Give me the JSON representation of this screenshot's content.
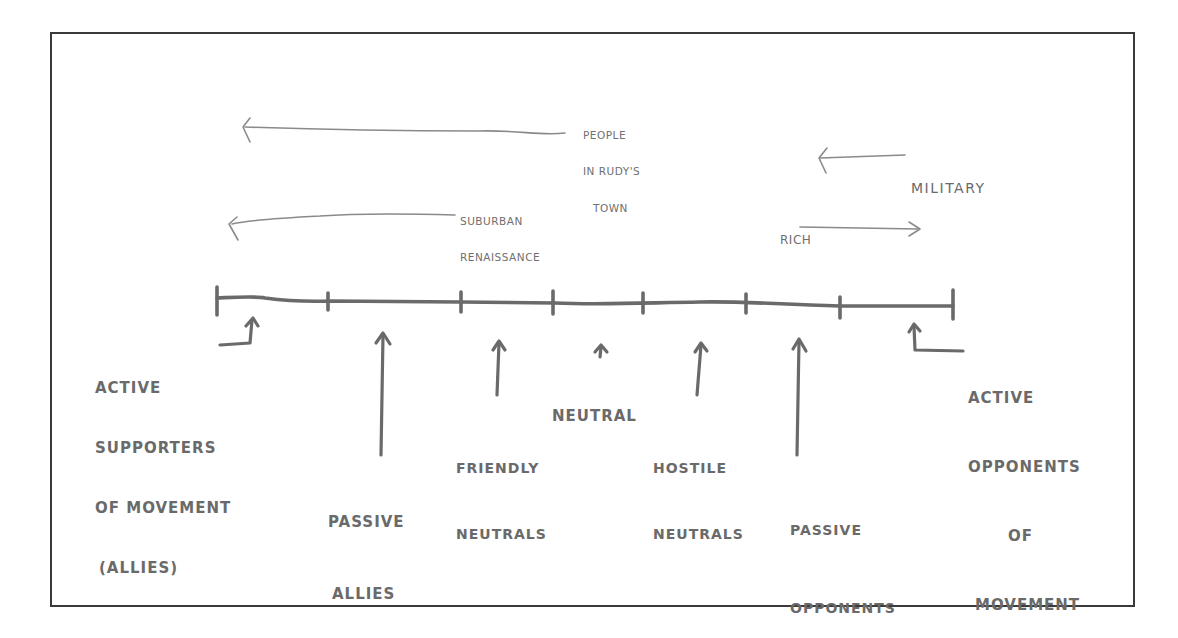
{
  "diagram": {
    "type": "spectrum-of-allegiance-sketch",
    "style": "hand-drawn",
    "stroke_color": "#6a6a6a",
    "frame_color": "#3a3a3a",
    "spectrum": {
      "left_end": "ACTIVE SUPPORTERS OF MOVEMENT (ALLIES)",
      "right_end": "ACTIVE OPPONENTS OF MOVEMENT",
      "tick_count": 8
    },
    "segments": [
      {
        "id": "active-supporters",
        "lines": [
          "ACTIVE",
          "SUPPORTERS",
          "OF MOVEMENT",
          "(ALLIES)"
        ]
      },
      {
        "id": "passive-allies",
        "lines": [
          "PASSIVE",
          "ALLIES"
        ]
      },
      {
        "id": "friendly-neutrals",
        "lines": [
          "FRIENDLY",
          "NEUTRALS"
        ]
      },
      {
        "id": "neutral",
        "lines": [
          "NEUTRAL"
        ]
      },
      {
        "id": "hostile-neutrals",
        "lines": [
          "HOSTILE",
          "NEUTRALS"
        ]
      },
      {
        "id": "passive-opponents",
        "lines": [
          "PASSIVE",
          "OPPONENTS"
        ]
      },
      {
        "id": "active-opponents",
        "lines": [
          "ACTIVE",
          "OPPONENTS",
          "OF",
          "MOVEMENT"
        ]
      }
    ],
    "shift_arrows": [
      {
        "id": "people-in-rudys-town",
        "lines": [
          "PEOPLE",
          "IN RUDY'S",
          "TOWN"
        ],
        "direction": "left"
      },
      {
        "id": "military",
        "lines": [
          "MILITARY"
        ],
        "direction": "left"
      },
      {
        "id": "suburban-renaissance",
        "lines": [
          "SUBURBAN",
          "RENAISSANCE"
        ],
        "direction": "left"
      },
      {
        "id": "rich",
        "lines": [
          "RICH"
        ],
        "direction": "right"
      }
    ]
  }
}
